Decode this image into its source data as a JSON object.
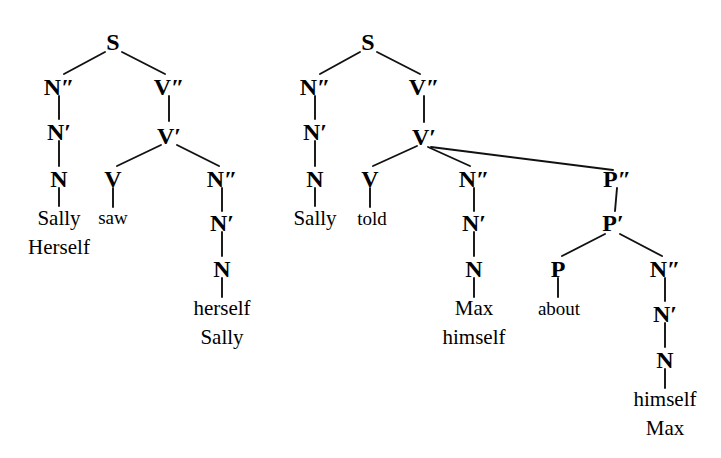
{
  "figure": {
    "type": "syntax-tree-diagram",
    "background_color": "#ffffff",
    "ink_color": "#000000",
    "tree_count": 2
  },
  "trees": [
    {
      "id": "tree-left",
      "root": "S",
      "sentence_variants": [
        "Sally saw herself",
        "Herself saw Sally"
      ],
      "nodes": {
        "s": "S",
        "subj_nbar2": "N″",
        "subj_nbar1": "N′",
        "subj_n": "N",
        "vbar2": "V″",
        "vbar1": "V′",
        "v": "V",
        "obj_nbar2": "N″",
        "obj_nbar1": "N′",
        "obj_n": "N"
      },
      "leaves": {
        "subject_line1": "Sally",
        "subject_line2": "Herself",
        "verb": "saw",
        "object_line1": "herself",
        "object_line2": "Sally"
      }
    },
    {
      "id": "tree-right",
      "root": "S",
      "sentence_variants": [
        "Sally told Max about himself",
        "Sally told himself about Max"
      ],
      "nodes": {
        "s": "S",
        "subj_nbar2": "N″",
        "subj_nbar1": "N′",
        "subj_n": "N",
        "vbar2": "V″",
        "vbar1": "V′",
        "v": "V",
        "obj_nbar2": "N″",
        "obj_nbar1": "N′",
        "obj_n": "N",
        "pbar2": "P″",
        "pbar1": "P′",
        "p": "P",
        "pobj_nbar2": "N″",
        "pobj_nbar1": "N′",
        "pobj_n": "N"
      },
      "leaves": {
        "subject": "Sally",
        "verb": "told",
        "object_line1": "Max",
        "object_line2": "himself",
        "preposition": "about",
        "pobject_line1": "himself",
        "pobject_line2": "Max"
      }
    }
  ]
}
